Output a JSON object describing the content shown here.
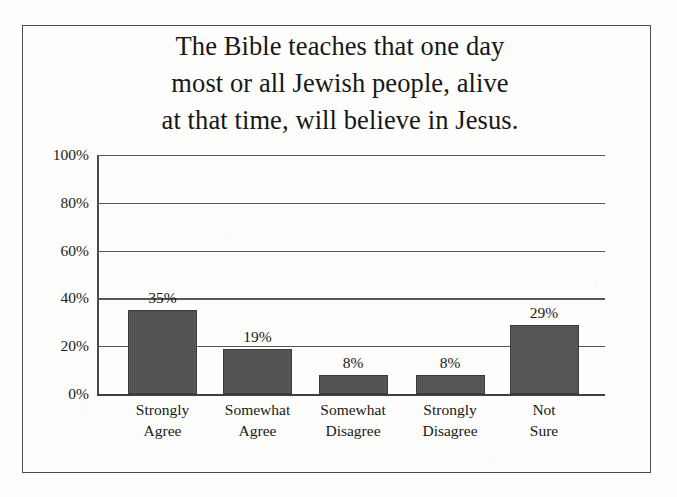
{
  "figure": {
    "title_lines": [
      "The Bible teaches that one day",
      "most or all Jewish people, alive",
      "at that time, will believe in Jesus."
    ],
    "bar_color": "#4b4b4b",
    "frame_color": "#4c4c4c",
    "background_color": "#fdfdfb"
  },
  "chart_data": {
    "type": "bar",
    "title": "The Bible teaches that one day most or all Jewish people, alive at that time, will believe in Jesus.",
    "categories": [
      "Strongly Agree",
      "Somewhat Agree",
      "Somewhat Disagree",
      "Strongly Disagree",
      "Not Sure"
    ],
    "category_lines": [
      [
        "Strongly",
        "Agree"
      ],
      [
        "Somewhat",
        "Agree"
      ],
      [
        "Somewhat",
        "Disagree"
      ],
      [
        "Strongly",
        "Disagree"
      ],
      [
        "Not",
        "Sure"
      ]
    ],
    "values": [
      35,
      19,
      8,
      8,
      29
    ],
    "value_labels": [
      "35%",
      "19%",
      "8%",
      "8%",
      "29%"
    ],
    "xlabel": "",
    "ylabel": "",
    "ylim": [
      0,
      100
    ],
    "yticks": [
      0,
      20,
      40,
      60,
      80,
      100
    ],
    "ytick_labels": [
      "0%",
      "20%",
      "40%",
      "60%",
      "80%",
      "100%"
    ],
    "grid": true,
    "legend": false,
    "series_name": ""
  }
}
